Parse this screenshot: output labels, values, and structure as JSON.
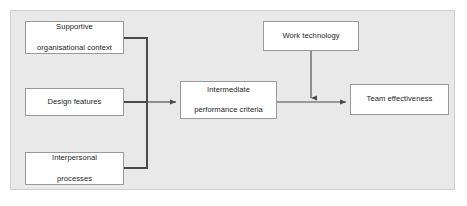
{
  "figure": {
    "panel_background": "#e9e9e9",
    "node_fill": "#ffffff",
    "node_border": "#9a9a9a",
    "connector_color": "#4a4a4a"
  },
  "nodes": [
    {
      "id": "supportive",
      "label": "Supportive\norganisational context",
      "line1": "Supportive",
      "line2": "organisational context"
    },
    {
      "id": "design",
      "label": "Design features",
      "line1": "Design features",
      "line2": ""
    },
    {
      "id": "interpersonal",
      "label": "Interpersonal\nprocesses",
      "line1": "Interpersonal",
      "line2": "processes"
    },
    {
      "id": "intermediate",
      "label": "Intermediate\nperformance criteria",
      "line1": "Intermediate",
      "line2": "performance criteria"
    },
    {
      "id": "worktech",
      "label": "Work technology",
      "line1": "Work technology",
      "line2": ""
    },
    {
      "id": "teameff",
      "label": "Team effectiveness",
      "line1": "Team effectiveness",
      "line2": ""
    }
  ],
  "connectors": [
    {
      "id": "supportive-to-bus",
      "from": "supportive",
      "to": "intermediate",
      "arrow": false
    },
    {
      "id": "design-to-bus",
      "from": "design",
      "to": "intermediate",
      "arrow": true
    },
    {
      "id": "interpersonal-to-bus",
      "from": "interpersonal",
      "to": "intermediate",
      "arrow": false
    },
    {
      "id": "worktech-to-link",
      "from": "worktech",
      "to": "teameff",
      "arrow": true
    },
    {
      "id": "intermediate-to-team",
      "from": "intermediate",
      "to": "teameff",
      "arrow": true
    }
  ]
}
